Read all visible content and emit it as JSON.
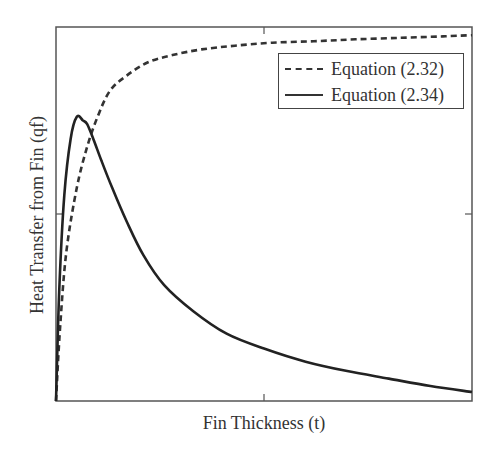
{
  "chart_data": {
    "type": "line",
    "title": "",
    "xlabel": "Fin Thickness (t)",
    "ylabel": "Heat Transfer from Fin (qf)",
    "xlim": [
      0,
      1
    ],
    "ylim": [
      0,
      1
    ],
    "xticks": [
      0.5
    ],
    "yticks": [
      0.5
    ],
    "tick_labels_shown": false,
    "grid": false,
    "legend_position": "upper right",
    "series": [
      {
        "name": "Equation (2.32)",
        "style": "dashed",
        "color": "#333333",
        "x": [
          0.0,
          0.01,
          0.025,
          0.05,
          0.075,
          0.1,
          0.13,
          0.17,
          0.22,
          0.28,
          0.35,
          0.43,
          0.52,
          0.62,
          0.72,
          0.83,
          0.93,
          1.0
        ],
        "y": [
          0.0,
          0.2,
          0.4,
          0.57,
          0.68,
          0.76,
          0.83,
          0.87,
          0.905,
          0.925,
          0.94,
          0.95,
          0.958,
          0.962,
          0.967,
          0.971,
          0.975,
          0.978
        ]
      },
      {
        "name": "Equation (2.34)",
        "style": "solid",
        "color": "#222222",
        "x": [
          0.0,
          0.008,
          0.02,
          0.035,
          0.05,
          0.065,
          0.075,
          0.09,
          0.11,
          0.135,
          0.17,
          0.21,
          0.26,
          0.33,
          0.41,
          0.5,
          0.6,
          0.7,
          0.8,
          0.9,
          1.0
        ],
        "y": [
          0.0,
          0.3,
          0.55,
          0.7,
          0.76,
          0.75,
          0.74,
          0.7,
          0.64,
          0.57,
          0.48,
          0.39,
          0.31,
          0.24,
          0.18,
          0.14,
          0.105,
          0.08,
          0.06,
          0.04,
          0.024
        ]
      }
    ]
  },
  "legend": {
    "items": [
      {
        "label": "Equation (2.32)",
        "style": "dashed"
      },
      {
        "label": "Equation (2.34)",
        "style": "solid"
      }
    ]
  },
  "axes": {
    "xlabel": "Fin Thickness (t)",
    "ylabel": "Heat Transfer from Fin (qf)"
  }
}
